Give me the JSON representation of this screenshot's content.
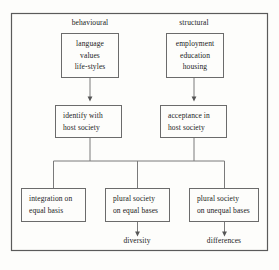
{
  "figure": {
    "type": "flowchart"
  },
  "columns": [
    {
      "id": "behavioural",
      "label": "behavioural",
      "x": 90,
      "y": 22
    },
    {
      "id": "structural",
      "label": "structural",
      "x": 194,
      "y": 22
    }
  ],
  "nodes": [
    {
      "id": "behavioural-inputs",
      "lines": [
        "language",
        "values",
        "life-styles"
      ],
      "x": 61,
      "y": 33,
      "w": 58,
      "h": 45,
      "align": "center"
    },
    {
      "id": "structural-inputs",
      "lines": [
        "employment",
        "education",
        "housing"
      ],
      "x": 166,
      "y": 33,
      "w": 58,
      "h": 45,
      "align": "center"
    },
    {
      "id": "identify-with-host-society",
      "lines": [
        "identify with",
        "host society"
      ],
      "x": 55,
      "y": 105,
      "w": 67,
      "h": 33,
      "align": "left"
    },
    {
      "id": "acceptance-in-host-society",
      "lines": [
        "acceptance in",
        "host society"
      ],
      "x": 160,
      "y": 105,
      "w": 67,
      "h": 33,
      "align": "left"
    },
    {
      "id": "integration-on-equal-basis",
      "lines": [
        "integration on",
        "equal basis"
      ],
      "x": 21,
      "y": 188,
      "w": 65,
      "h": 34,
      "align": "left"
    },
    {
      "id": "plural-society-equal-bases",
      "lines": [
        "plural society",
        "on equal bases"
      ],
      "x": 105,
      "y": 188,
      "w": 65,
      "h": 34,
      "align": "left"
    },
    {
      "id": "plural-society-unequal-bases",
      "lines": [
        "plural society",
        "on unequal bases"
      ],
      "x": 189,
      "y": 188,
      "w": 70,
      "h": 34,
      "align": "left"
    }
  ],
  "outcomes": [
    {
      "id": "diversity",
      "label": "diversity",
      "x": 137,
      "y": 240
    },
    {
      "id": "differences",
      "label": "differences",
      "x": 224,
      "y": 240
    }
  ],
  "style": {
    "frame_color": "#5a5a5a",
    "line_color": "#7a7a7a",
    "box_border": "#6b6b6b",
    "text_color": "#1a1a1a",
    "background": "#fdfdfb"
  }
}
